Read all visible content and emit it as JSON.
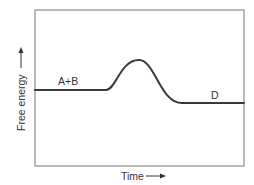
{
  "diagram": {
    "colors": {
      "background": "#ffffff",
      "frame": "#8a8a8a",
      "curve": "#3a3a3a",
      "text": "#333333"
    },
    "frame": {
      "x": 35,
      "y": 10,
      "width": 209,
      "height": 156
    },
    "axes": {
      "y_label": "Free energy",
      "x_label": "Time",
      "y_arrow_icon": "arrow-up-icon",
      "x_arrow_icon": "arrow-right-icon"
    },
    "curve": {
      "description": "Reactant plateau, rises to a single transition-state peak, falls to a lower product plateau",
      "start": {
        "x": 35,
        "y": 90
      },
      "rise_start": {
        "x": 106,
        "y": 90
      },
      "peak": {
        "x": 139,
        "y": 60
      },
      "fall_end": {
        "x": 182,
        "y": 103
      },
      "end": {
        "x": 244,
        "y": 103
      }
    },
    "labels": {
      "reactants": "A+B",
      "products": "D"
    }
  }
}
